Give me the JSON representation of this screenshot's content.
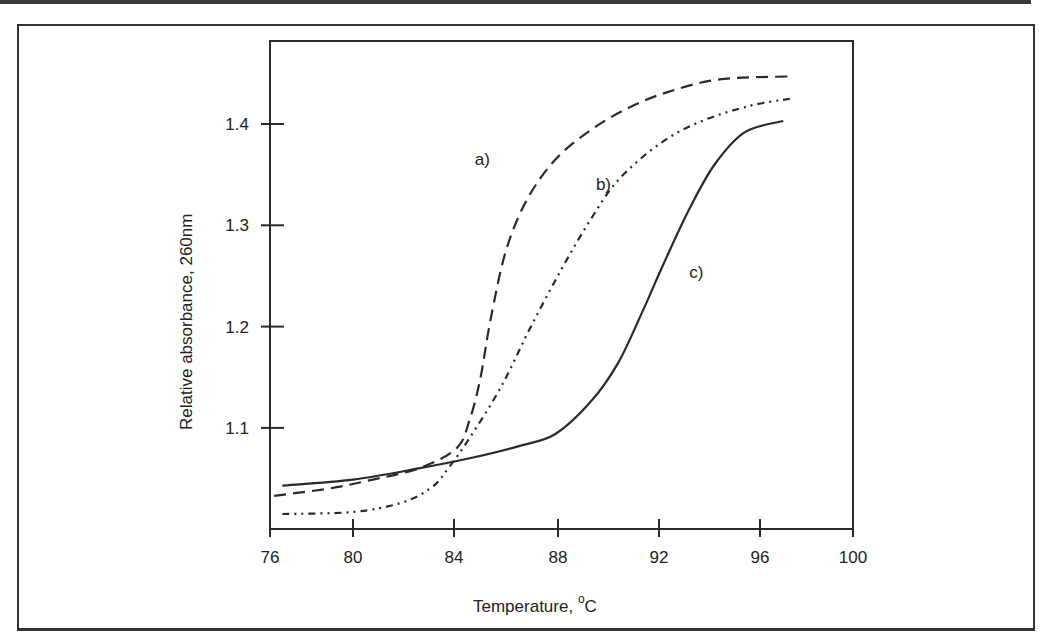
{
  "chart_data": {
    "type": "line",
    "title": "",
    "xlabel": "Temperature, °C",
    "xlabel_main": "Temperature, ",
    "xlabel_sup": "o",
    "xlabel_unit": "C",
    "ylabel": "Relative absorbance, 260nm",
    "xlim": [
      76,
      100
    ],
    "ylim": [
      1.0,
      1.48
    ],
    "xticks": [
      76,
      80,
      84,
      88,
      92,
      96,
      100
    ],
    "xtick_labels": [
      "76",
      "80",
      "84",
      "88",
      "92",
      "96",
      "100"
    ],
    "yticks": [
      1.1,
      1.2,
      1.3,
      1.4
    ],
    "ytick_labels": [
      "1.1",
      "1.2",
      "1.3",
      "1.4"
    ],
    "grid": false,
    "legend": "inline curve labels",
    "series": [
      {
        "name": "a)",
        "style": "dashed",
        "x": [
          76.2,
          78.8,
          80.6,
          82.6,
          84.1,
          84.6,
          85.0,
          85.4,
          86.0,
          86.8,
          87.9,
          89.3,
          90.8,
          92.4,
          94.4,
          97.3
        ],
        "y": [
          1.033,
          1.04,
          1.048,
          1.06,
          1.08,
          1.108,
          1.147,
          1.206,
          1.275,
          1.325,
          1.365,
          1.394,
          1.416,
          1.432,
          1.444,
          1.447
        ]
      },
      {
        "name": "b)",
        "style": "dash-dot-dot",
        "x": [
          76.6,
          80.0,
          81.9,
          83.1,
          83.8,
          84.6,
          85.8,
          86.9,
          88.1,
          89.3,
          90.4,
          92.0,
          93.6,
          95.6,
          97.3
        ],
        "y": [
          1.015,
          1.017,
          1.026,
          1.041,
          1.061,
          1.09,
          1.14,
          1.197,
          1.255,
          1.306,
          1.345,
          1.38,
          1.402,
          1.418,
          1.425
        ]
      },
      {
        "name": "c)",
        "style": "solid",
        "x": [
          76.6,
          80.0,
          82.6,
          84.6,
          86.5,
          87.9,
          89.3,
          90.4,
          91.4,
          92.2,
          93.2,
          94.2,
          95.4,
          97.0
        ],
        "y": [
          1.043,
          1.049,
          1.06,
          1.07,
          1.082,
          1.094,
          1.126,
          1.165,
          1.218,
          1.263,
          1.316,
          1.36,
          1.392,
          1.403
        ]
      }
    ],
    "annotations": [
      {
        "text": "a)",
        "x": 84.8,
        "y": 1.36
      },
      {
        "text": "b)",
        "x": 89.5,
        "y": 1.335
      },
      {
        "text": "c)",
        "x": 93.2,
        "y": 1.248
      }
    ]
  },
  "labels": {
    "a": "a)",
    "b": "b)",
    "c": "c)"
  }
}
